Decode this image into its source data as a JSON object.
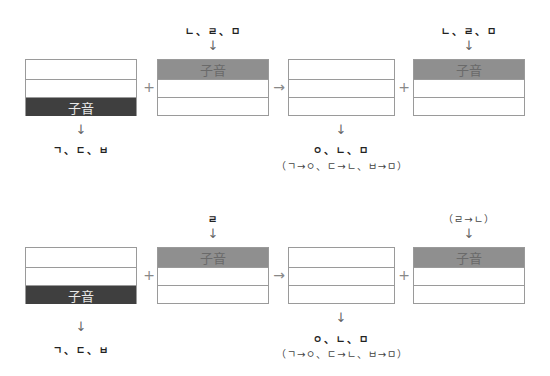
{
  "colors": {
    "dark_fill": "#3f3f3f",
    "mid_fill": "#8f8f8f",
    "border": "#9a9a9a"
  },
  "rows": [
    {
      "top_labels": {
        "box2": "ㄴ、ㄹ、ㅁ",
        "box4": "ㄴ、ㄹ、ㅁ"
      },
      "boxes": [
        {
          "name": "syllable-1",
          "highlight_row": 2,
          "highlight_label": "子音"
        },
        {
          "name": "syllable-2",
          "highlight_row": 0,
          "highlight_label": "子音"
        },
        {
          "name": "result",
          "highlight_row": null,
          "highlight_label": ""
        },
        {
          "name": "syllable-2-result",
          "highlight_row": 0,
          "highlight_label": "子音"
        }
      ],
      "operators": [
        "+",
        "→",
        "+"
      ],
      "bottom_labels": {
        "box1": "ㄱ、ㄷ、ㅂ",
        "box3_line1": "ㅇ、ㄴ、ㅁ",
        "box3_line2": "（ㄱ→ㅇ、ㄷ→ㄴ、ㅂ→ㅁ）"
      }
    },
    {
      "top_labels": {
        "box2": "ㄹ",
        "box4": "（ㄹ→ㄴ）"
      },
      "boxes": [
        {
          "name": "syllable-1",
          "highlight_row": 2,
          "highlight_label": "子音"
        },
        {
          "name": "syllable-2",
          "highlight_row": 0,
          "highlight_label": "子音"
        },
        {
          "name": "result",
          "highlight_row": null,
          "highlight_label": ""
        },
        {
          "name": "syllable-2-result",
          "highlight_row": 0,
          "highlight_label": "子音"
        }
      ],
      "operators": [
        "+",
        "→",
        "+"
      ],
      "bottom_labels": {
        "box1": "ㄱ、ㄷ、ㅂ",
        "box3_line1": "ㅇ、ㄴ、ㅁ",
        "box3_line2": "（ㄱ→ㅇ、ㄷ→ㄴ、ㅂ→ㅁ）"
      }
    }
  ],
  "arrow_down": "↓"
}
